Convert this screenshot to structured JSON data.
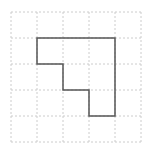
{
  "diagram": {
    "type": "grid-polygon",
    "grid": {
      "columns": 5,
      "rows": 5,
      "line_style": "dashed",
      "line_color": "#cccccc"
    },
    "shape": {
      "description": "staircase polygon on grid",
      "stroke_color": "#555555",
      "vertices_grid_units": [
        [
          1,
          1
        ],
        [
          4,
          1
        ],
        [
          4,
          4
        ],
        [
          3,
          4
        ],
        [
          3,
          3
        ],
        [
          2,
          3
        ],
        [
          2,
          2
        ],
        [
          1,
          2
        ]
      ]
    }
  }
}
